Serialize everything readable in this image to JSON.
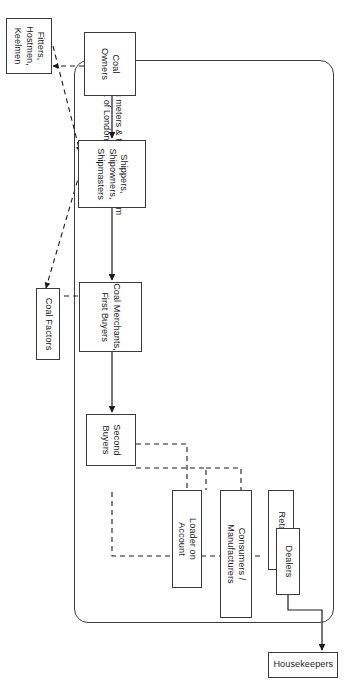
{
  "diagram": {
    "orientation": "rotated-90-clockwise",
    "stroke_color": "#3a3a3a",
    "text_color": "#1a1a1a",
    "background": "#ffffff",
    "group": {
      "label": "Public meters & the metage system\n(Corp. of London)",
      "shape": "rounded-rectangle"
    },
    "nodes": [
      {
        "id": "loader_on_account",
        "label": "Loader on\nAccount"
      },
      {
        "id": "consumers_manufacturers",
        "label": "Consumers /\nManufacturers"
      },
      {
        "id": "retailers",
        "label": "Retailers"
      },
      {
        "id": "dealers",
        "label": "Dealers"
      },
      {
        "id": "second_buyers",
        "label": "Second\nBuyers"
      },
      {
        "id": "coal_merchants_first_buyers",
        "label": "Coal Merchants,\nFirst Buyers"
      },
      {
        "id": "coal_factors",
        "label": "Coal Factors"
      },
      {
        "id": "shippers",
        "label": "Shippers,\nShipowners,\nShipmasters"
      },
      {
        "id": "coal_owners",
        "label": "Coal\nOwners"
      },
      {
        "id": "fitters",
        "label": "Fitters,\nHostmen,\nKeelmen"
      },
      {
        "id": "housekeepers",
        "label": "Housekeepers"
      }
    ],
    "edges": [
      {
        "from": "coal_owners",
        "to": "shippers",
        "style": "solid",
        "arrow": true
      },
      {
        "from": "coal_owners",
        "to": "fitters",
        "style": "dashed",
        "arrow": true
      },
      {
        "from": "fitters",
        "to": "shippers",
        "style": "dashed",
        "arrow": true
      },
      {
        "from": "shippers",
        "to": "coal_merchants_first_buyers",
        "style": "solid",
        "arrow": true
      },
      {
        "from": "shippers",
        "to": "coal_factors",
        "style": "dashed",
        "arrow": true
      },
      {
        "from": "coal_factors",
        "to": "coal_merchants_first_buyers",
        "style": "dashed",
        "arrow": true
      },
      {
        "from": "coal_merchants_first_buyers",
        "to": "second_buyers",
        "style": "solid",
        "arrow": true
      },
      {
        "from": "second_buyers",
        "to": "loader_on_account",
        "style": "dashed",
        "arrow": false
      },
      {
        "from": "second_buyers",
        "to": "consumers_manufacturers",
        "style": "dashed",
        "arrow": false
      },
      {
        "from": "second_buyers",
        "to": "retailers",
        "style": "dashed",
        "arrow": false
      },
      {
        "from": "second_buyers",
        "to": "dealers",
        "style": "dashed",
        "arrow": false
      },
      {
        "from": "dealers",
        "to": "housekeepers",
        "style": "solid",
        "arrow": true
      }
    ]
  }
}
